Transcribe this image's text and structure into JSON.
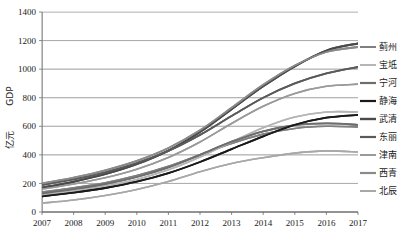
{
  "chart_data": {
    "type": "line",
    "title": "",
    "subtitle": "",
    "xlabel": "",
    "ylabel": "GDP 亿元",
    "ylabel_line1": "GDP",
    "ylabel_line2": "亿元",
    "x": [
      2007,
      2008,
      2009,
      2010,
      2011,
      2012,
      2013,
      2014,
      2015,
      2016,
      2017
    ],
    "xticklabels": [
      "2007",
      "2008",
      "2009",
      "2010",
      "2011",
      "2012",
      "2013",
      "2014",
      "2015",
      "2016",
      "2017"
    ],
    "yticklabels": [
      "0",
      "200",
      "400",
      "600",
      "800",
      "1000",
      "1200",
      "1400"
    ],
    "yticks": [
      0,
      200,
      400,
      600,
      800,
      1000,
      1200,
      1400
    ],
    "ylim": [
      0,
      1400
    ],
    "xlim": [
      2007,
      2017
    ],
    "grid": true,
    "legend_position": "right",
    "series": [
      {
        "name": "蓟州",
        "color": "#808080",
        "width": 1.6,
        "values": [
          140,
          170,
          205,
          255,
          320,
          400,
          480,
          545,
          585,
          600,
          595
        ]
      },
      {
        "name": "宝坻",
        "color": "#b5b5b5",
        "width": 1.6,
        "values": [
          120,
          148,
          182,
          228,
          295,
          385,
          490,
          590,
          665,
          700,
          700
        ]
      },
      {
        "name": "宁河",
        "color": "#6e6e6e",
        "width": 1.8,
        "values": [
          130,
          160,
          196,
          245,
          312,
          400,
          492,
          565,
          608,
          620,
          610
        ]
      },
      {
        "name": "静海",
        "color": "#1a1a1a",
        "width": 1.8,
        "values": [
          110,
          136,
          168,
          212,
          272,
          350,
          440,
          530,
          610,
          660,
          680
        ]
      },
      {
        "name": "武清",
        "color": "#4a4a4a",
        "width": 2.0,
        "values": [
          170,
          212,
          265,
          335,
          430,
          560,
          720,
          880,
          1020,
          1130,
          1180
        ]
      },
      {
        "name": "东丽",
        "color": "#5a5a5a",
        "width": 1.8,
        "values": [
          190,
          228,
          278,
          342,
          428,
          540,
          672,
          800,
          900,
          970,
          1015
        ]
      },
      {
        "name": "津南",
        "color": "#9a9a9a",
        "width": 1.6,
        "values": [
          160,
          196,
          240,
          300,
          382,
          490,
          620,
          740,
          830,
          880,
          895
        ]
      },
      {
        "name": "西青",
        "color": "#8a8a8a",
        "width": 1.8,
        "values": [
          200,
          240,
          292,
          358,
          448,
          572,
          730,
          890,
          1025,
          1120,
          1155
        ]
      },
      {
        "name": "北辰",
        "color": "#a8a8a8",
        "width": 1.6,
        "values": [
          62,
          84,
          116,
          158,
          214,
          282,
          340,
          380,
          412,
          428,
          420
        ]
      }
    ]
  }
}
